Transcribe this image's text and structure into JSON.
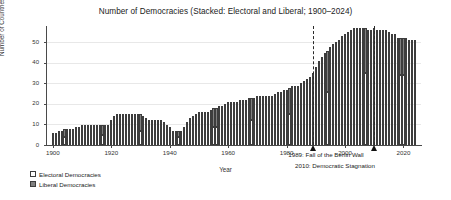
{
  "chart_data": {
    "type": "bar",
    "stacked": true,
    "title": "Number of Democracies (Stacked: Electoral and Liberal; 1900–2024)",
    "xlabel": "Year",
    "ylabel": "Number of Countries",
    "xlim": [
      1898,
      2026
    ],
    "ylim": [
      0,
      58
    ],
    "xticks": [
      1900,
      1920,
      1940,
      1960,
      1980,
      2000,
      2020
    ],
    "yticks": [
      0,
      10,
      20,
      30,
      40,
      50
    ],
    "grid": true,
    "legend_position": "below-left",
    "series": [
      {
        "name": "Electoral Democracies",
        "color": "#ffffff",
        "values": [
          3,
          3,
          3,
          3,
          4,
          4,
          4,
          4,
          4,
          4,
          5,
          5,
          5,
          5,
          5,
          5,
          5,
          5,
          5,
          5,
          6,
          7,
          7,
          7,
          7,
          7,
          7,
          7,
          7,
          7,
          7,
          7,
          6,
          6,
          6,
          6,
          6,
          6,
          6,
          5,
          5,
          4,
          4,
          4,
          4,
          5,
          6,
          7,
          7,
          8,
          8,
          8,
          8,
          8,
          9,
          9,
          9,
          10,
          10,
          11,
          11,
          11,
          11,
          11,
          12,
          12,
          12,
          12,
          12,
          12,
          13,
          13,
          13,
          13,
          13,
          13,
          14,
          14,
          14,
          15,
          15,
          15,
          16,
          16,
          16,
          16,
          17,
          17,
          18,
          19,
          21,
          23,
          24,
          25,
          26,
          27,
          28,
          29,
          30,
          31,
          32,
          33,
          33,
          34,
          34,
          35,
          35,
          35,
          35,
          35,
          36,
          36,
          36,
          36,
          36,
          35,
          35,
          35,
          34,
          34,
          34,
          34,
          34,
          34,
          34
        ]
      },
      {
        "name": "Liberal Democracies",
        "color": "#808080",
        "values": [
          3,
          3,
          4,
          4,
          4,
          4,
          4,
          4,
          5,
          5,
          5,
          5,
          5,
          5,
          5,
          5,
          5,
          5,
          5,
          5,
          6,
          7,
          8,
          8,
          8,
          8,
          8,
          8,
          8,
          8,
          8,
          7,
          7,
          6,
          6,
          6,
          6,
          6,
          5,
          5,
          4,
          3,
          3,
          3,
          3,
          4,
          5,
          6,
          7,
          7,
          8,
          8,
          8,
          8,
          8,
          9,
          9,
          9,
          9,
          9,
          10,
          10,
          10,
          10,
          10,
          10,
          10,
          11,
          11,
          11,
          11,
          11,
          11,
          11,
          11,
          11,
          11,
          12,
          12,
          12,
          12,
          13,
          13,
          13,
          13,
          14,
          14,
          15,
          15,
          16,
          17,
          18,
          19,
          20,
          20,
          21,
          21,
          21,
          21,
          22,
          22,
          22,
          23,
          23,
          23,
          22,
          22,
          22,
          21,
          21,
          21,
          20,
          20,
          20,
          20,
          20,
          19,
          19,
          18,
          18,
          18,
          18,
          17,
          17,
          17
        ]
      }
    ],
    "years_start": 1900,
    "years_end": 2024,
    "annotations": [
      {
        "year": 1989,
        "label": "1989: Fall of the Berlin Wall"
      },
      {
        "year": 2010,
        "label": "2010: Democratic Stagnation"
      }
    ]
  },
  "legend": {
    "items": [
      {
        "label": "Electoral Democracies",
        "swatch": "sw-ele"
      },
      {
        "label": "Liberal Democracies",
        "swatch": "sw-lib"
      }
    ]
  }
}
